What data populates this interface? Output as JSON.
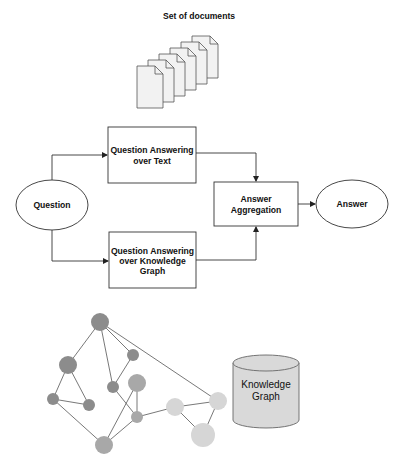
{
  "title": "Set of documents",
  "documents": {
    "count": 6,
    "fill": "#f2f2f2",
    "stroke": "#555555"
  },
  "nodes": {
    "question": {
      "label": "Question"
    },
    "qa_text": {
      "lines": [
        "Question Answering",
        "over Text"
      ]
    },
    "qa_kg": {
      "lines": [
        "Question Answering",
        "over Knowledge",
        "Graph"
      ]
    },
    "aggregation": {
      "lines": [
        "Answer",
        "Aggregation"
      ]
    },
    "answer": {
      "label": "Answer"
    }
  },
  "database": {
    "lines": [
      "Knowledge",
      "Graph"
    ],
    "fill": "#d9d9d9",
    "stroke": "#666666"
  },
  "graph": {
    "colors": {
      "dark": "#8c8c8c",
      "medium": "#a8a8a8",
      "light": "#d6d6d6",
      "edge": "#555555"
    },
    "nodes": [
      {
        "id": 1,
        "x": 100,
        "y": 322,
        "r": 9,
        "shade": "dark"
      },
      {
        "id": 2,
        "x": 68,
        "y": 365,
        "r": 9,
        "shade": "dark"
      },
      {
        "id": 3,
        "x": 133,
        "y": 355,
        "r": 6,
        "shade": "dark"
      },
      {
        "id": 4,
        "x": 113,
        "y": 387,
        "r": 6,
        "shade": "dark"
      },
      {
        "id": 5,
        "x": 137,
        "y": 383,
        "r": 9,
        "shade": "medium"
      },
      {
        "id": 6,
        "x": 53,
        "y": 399,
        "r": 6,
        "shade": "dark"
      },
      {
        "id": 7,
        "x": 89,
        "y": 405,
        "r": 6,
        "shade": "dark"
      },
      {
        "id": 8,
        "x": 137,
        "y": 417,
        "r": 6,
        "shade": "medium"
      },
      {
        "id": 9,
        "x": 104,
        "y": 445,
        "r": 9,
        "shade": "medium"
      },
      {
        "id": 10,
        "x": 175,
        "y": 407,
        "r": 9,
        "shade": "light"
      },
      {
        "id": 11,
        "x": 218,
        "y": 401,
        "r": 9,
        "shade": "light"
      },
      {
        "id": 12,
        "x": 203,
        "y": 435,
        "r": 12,
        "shade": "light"
      }
    ],
    "edges": [
      [
        1,
        2
      ],
      [
        1,
        3
      ],
      [
        1,
        4
      ],
      [
        1,
        11
      ],
      [
        3,
        4
      ],
      [
        2,
        6
      ],
      [
        2,
        7
      ],
      [
        6,
        7
      ],
      [
        6,
        9
      ],
      [
        4,
        8
      ],
      [
        5,
        8
      ],
      [
        5,
        9
      ],
      [
        8,
        9
      ],
      [
        8,
        10
      ],
      [
        10,
        11
      ],
      [
        10,
        12
      ],
      [
        11,
        12
      ]
    ]
  }
}
